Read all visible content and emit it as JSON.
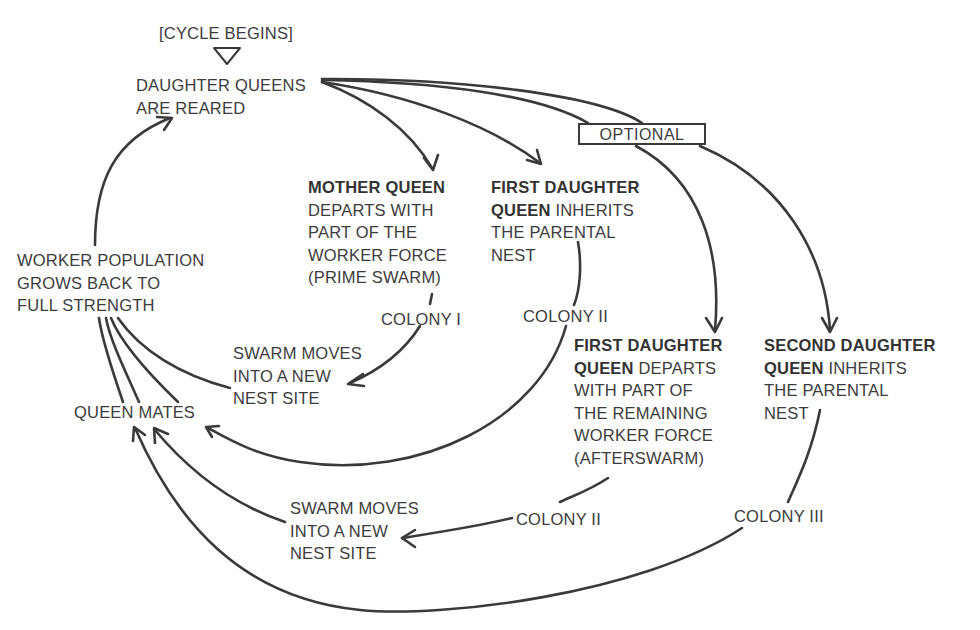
{
  "diagram": {
    "type": "flowchart-cycle",
    "colors": {
      "ink": "#3a3a3a",
      "background": "#ffffff"
    },
    "start_marker": {
      "label": "[CYCLE BEGINS]",
      "icon": "triangle-down-icon"
    },
    "nodes": {
      "daughter_queens_reared": {
        "lines": [
          "DAUGHTER QUEENS",
          "ARE REARED"
        ]
      },
      "optional": {
        "label": "OPTIONAL"
      },
      "mother_queen": {
        "bold": "MOTHER QUEEN",
        "lines": [
          "DEPARTS WITH",
          "PART OF THE",
          "WORKER FORCE",
          "(PRIME SWARM)"
        ]
      },
      "first_daughter_inherits": {
        "bold1": "FIRST DAUGHTER",
        "bold2": "QUEEN",
        "rest2": " INHERITS",
        "lines": [
          "THE PARENTAL",
          "NEST"
        ]
      },
      "first_daughter_departs": {
        "bold1": "FIRST DAUGHTER",
        "bold2": "QUEEN",
        "rest2": " DEPARTS",
        "lines": [
          "WITH PART OF",
          "THE REMAINING",
          "WORKER FORCE",
          "(AFTERSWARM)"
        ]
      },
      "second_daughter_inherits": {
        "bold1": "SECOND DAUGHTER",
        "bold2": "QUEEN",
        "rest2": " INHERITS",
        "lines": [
          "THE PARENTAL",
          "NEST"
        ]
      },
      "colony_1": {
        "label": "COLONY I"
      },
      "colony_2a": {
        "label": "COLONY II"
      },
      "colony_2b": {
        "label": "COLONY II"
      },
      "colony_3": {
        "label": "COLONY III"
      },
      "swarm_moves_1": {
        "lines": [
          "SWARM MOVES",
          "INTO A NEW",
          "NEST SITE"
        ]
      },
      "swarm_moves_2": {
        "lines": [
          "SWARM MOVES",
          "INTO A NEW",
          "NEST SITE"
        ]
      },
      "queen_mates": {
        "label": "QUEEN MATES"
      },
      "worker_population": {
        "lines": [
          "WORKER POPULATION",
          "GROWS BACK TO",
          "FULL STRENGTH"
        ]
      }
    },
    "edges": [
      {
        "from": "daughter_queens_reared",
        "to": "mother_queen"
      },
      {
        "from": "daughter_queens_reared",
        "to": "first_daughter_inherits"
      },
      {
        "from": "daughter_queens_reared",
        "to": "first_daughter_departs",
        "via": "optional"
      },
      {
        "from": "daughter_queens_reared",
        "to": "second_daughter_inherits",
        "via": "optional"
      },
      {
        "from": "mother_queen",
        "to": "colony_1"
      },
      {
        "from": "colony_1",
        "to": "swarm_moves_1"
      },
      {
        "from": "first_daughter_inherits",
        "to": "colony_2a"
      },
      {
        "from": "colony_2a",
        "to": "queen_mates"
      },
      {
        "from": "first_daughter_departs",
        "to": "colony_2b"
      },
      {
        "from": "colony_2b",
        "to": "swarm_moves_2"
      },
      {
        "from": "swarm_moves_2",
        "to": "queen_mates"
      },
      {
        "from": "second_daughter_inherits",
        "to": "colony_3"
      },
      {
        "from": "colony_3",
        "to": "queen_mates"
      },
      {
        "from": "swarm_moves_1",
        "to": "worker_population"
      },
      {
        "from": "queen_mates",
        "to": "worker_population"
      },
      {
        "from": "worker_population",
        "to": "daughter_queens_reared"
      }
    ]
  }
}
